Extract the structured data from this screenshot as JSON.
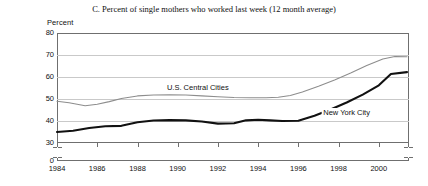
{
  "chart_data": {
    "type": "line",
    "title": "C. Percent of single mothers who worked last week (12 month average)",
    "ylabel": "Percent",
    "xlabel": "",
    "ylim": [
      30,
      80
    ],
    "zero_label": "0",
    "axis_break": true,
    "grid": true,
    "legend_position": "inline-labels",
    "yticks": [
      80,
      70,
      60,
      50,
      40,
      30
    ],
    "ytick_labels": [
      "80",
      "70",
      "60",
      "50",
      "40",
      "30"
    ],
    "xticks": [
      1984,
      1986,
      1988,
      1990,
      1992,
      1994,
      1996,
      1998,
      2000
    ],
    "xtick_labels": [
      "1984",
      "1986",
      "1988",
      "1990",
      "1992",
      "1994",
      "1996",
      "1998",
      "2000"
    ],
    "xlim": [
      1984,
      2001.5
    ],
    "series": [
      {
        "name": "U.S. Central Cities",
        "color": "#8d8d8d",
        "x": [
          1984,
          1984.6,
          1985.4,
          1986.0,
          1986.6,
          1987.2,
          1988.0,
          1988.8,
          1989.6,
          1990.4,
          1991.2,
          1992.0,
          1992.8,
          1993.6,
          1994.4,
          1995.0,
          1995.6,
          1996.2,
          1997.0,
          1997.8,
          1998.6,
          1999.4,
          2000.2,
          2000.8,
          2001.4
        ],
        "values": [
          49.0,
          48.3,
          46.9,
          47.6,
          48.8,
          50.2,
          51.4,
          51.8,
          51.9,
          51.8,
          51.4,
          51.0,
          50.7,
          50.6,
          50.6,
          50.8,
          51.6,
          53.2,
          55.8,
          58.6,
          61.8,
          65.2,
          68.2,
          69.3,
          69.2
        ]
      },
      {
        "name": "New York City",
        "color": "#111111",
        "x": [
          1984,
          1984.8,
          1985.6,
          1986.4,
          1987.2,
          1988.0,
          1988.8,
          1989.6,
          1990.4,
          1991.2,
          1992.0,
          1992.8,
          1993.4,
          1994.0,
          1994.6,
          1995.2,
          1996.0,
          1996.8,
          1997.6,
          1998.4,
          1999.2,
          2000.0,
          2000.6,
          2001.4
        ],
        "values": [
          35.0,
          35.6,
          36.8,
          37.6,
          37.8,
          39.4,
          40.2,
          40.4,
          40.3,
          39.8,
          38.8,
          39.0,
          40.3,
          40.6,
          40.3,
          40.0,
          40.1,
          42.4,
          45.2,
          48.4,
          52.0,
          56.2,
          61.4,
          62.2
        ]
      }
    ],
    "annotations": [
      {
        "text": "U.S. Central Cities",
        "x": 1991.0,
        "y": 55.0
      },
      {
        "text": "New York City",
        "x": 1998.4,
        "y": 43.5
      }
    ]
  }
}
